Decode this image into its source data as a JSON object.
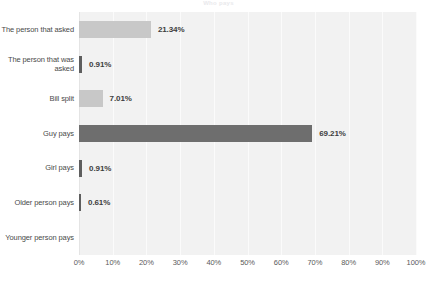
{
  "chart_data": {
    "type": "bar",
    "orientation": "horizontal",
    "title": "Who pays",
    "xlabel": "",
    "ylabel": "",
    "xlim": [
      0,
      100
    ],
    "grid": true,
    "legend": "none",
    "watermark": "",
    "categories": [
      "The person that asked",
      "The person that was asked",
      "Bill split",
      "Guy pays",
      "Girl pays",
      "Older person pays",
      "Younger person pays"
    ],
    "values": [
      21.34,
      0.91,
      7.01,
      69.21,
      0.91,
      0.61,
      0.0
    ],
    "value_labels": [
      "21.34%",
      "0.91%",
      "7.01%",
      "69.21%",
      "0.91%",
      "0.61%",
      ""
    ],
    "bar_colors": [
      "#c8c8c8",
      "#5e5e5e",
      "#c8c8c8",
      "#6e6e6e",
      "#5e5e5e",
      "#5e5e5e",
      "#c8c8c8"
    ],
    "tick_labels": [
      "0%",
      "10%",
      "20%",
      "30%",
      "40%",
      "50%",
      "60%",
      "70%",
      "80%",
      "90%",
      "100%"
    ],
    "tick_values": [
      0,
      10,
      20,
      30,
      40,
      50,
      60,
      70,
      80,
      90,
      100
    ]
  },
  "colors": {
    "plot_background": "#f2f2f2",
    "page_background": "#ffffff",
    "bar_light": "#c8c8c8",
    "bar_dark": "#6e6e6e",
    "gridline": "#fbfbfb",
    "label_text": "#4a4a4a",
    "value_text": "#3d3d3d"
  }
}
